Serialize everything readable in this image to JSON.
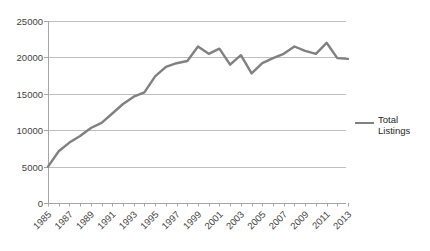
{
  "chart_data": {
    "type": "line",
    "x": [
      1985,
      1986,
      1987,
      1988,
      1989,
      1990,
      1991,
      1992,
      1993,
      1994,
      1995,
      1996,
      1997,
      1998,
      1999,
      2000,
      2001,
      2002,
      2003,
      2004,
      2005,
      2006,
      2007,
      2008,
      2009,
      2010,
      2011,
      2012,
      2013
    ],
    "series": [
      {
        "name": "Total Listings",
        "values": [
          5000,
          7100,
          8300,
          9200,
          10300,
          11000,
          12300,
          13600,
          14600,
          15200,
          17400,
          18700,
          19200,
          19500,
          21500,
          20500,
          21200,
          19000,
          20300,
          17800,
          19200,
          19900,
          20500,
          21500,
          20900,
          20500,
          22000,
          19900,
          19800
        ]
      }
    ],
    "ylim": [
      0,
      25000
    ],
    "yticks": [
      0,
      5000,
      10000,
      15000,
      20000,
      25000
    ],
    "xtick_labels": [
      "1985",
      "1987",
      "1989",
      "1991",
      "1993",
      "1995",
      "1997",
      "1999",
      "2001",
      "2003",
      "2005",
      "2007",
      "2009",
      "2011",
      "2013"
    ],
    "xtick_label_rotation_deg": -45,
    "grid": "horizontal",
    "legend_position": "right",
    "colors": {
      "line": "#808080",
      "gridline": "#BFBFBF",
      "axis": "#A6A6A6",
      "tick_label": "#3F3F3F",
      "legend_text": "#262626",
      "background": "#FFFFFF"
    }
  },
  "legend": {
    "label": "Total Listings"
  }
}
